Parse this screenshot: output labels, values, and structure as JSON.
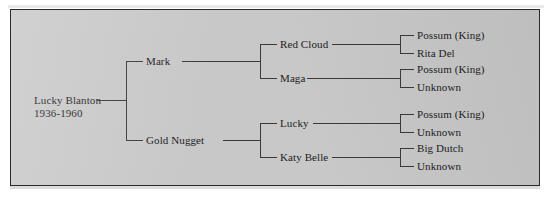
{
  "figure": {
    "type": "pedigree-chart",
    "generations": 4,
    "panel_background": "#c8c8c8",
    "line_color": "#3a3a3a",
    "text_color": "#1c1c1c"
  },
  "tree": {
    "root": {
      "name": "Lucky Blanton",
      "years": "1936-1960"
    },
    "generation2": [
      {
        "name": "Mark"
      },
      {
        "name": "Gold Nugget"
      }
    ],
    "generation3": [
      {
        "name": "Red Cloud"
      },
      {
        "name": "Maga"
      },
      {
        "name": "Lucky"
      },
      {
        "name": "Katy Belle"
      }
    ],
    "generation4": [
      {
        "name": "Possum (King)"
      },
      {
        "name": "Rita Del"
      },
      {
        "name": "Possum (King)"
      },
      {
        "name": "Unknown"
      },
      {
        "name": "Possum (King)"
      },
      {
        "name": "Unknown"
      },
      {
        "name": "Big Dutch"
      },
      {
        "name": "Unknown"
      }
    ]
  }
}
